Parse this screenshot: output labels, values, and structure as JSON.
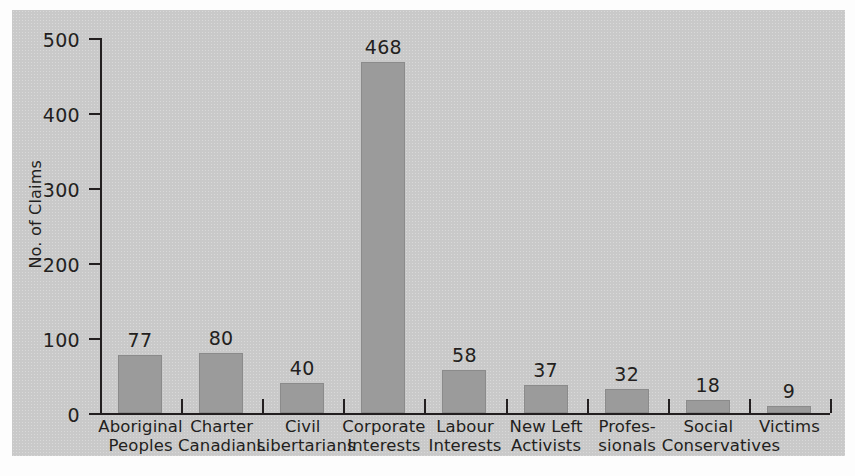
{
  "chart_data": {
    "type": "bar",
    "title": "",
    "xlabel": "",
    "ylabel": "No. of Claims",
    "ylim": [
      0,
      500
    ],
    "yticks": [
      0,
      100,
      200,
      300,
      400,
      500
    ],
    "ytick_labels": [
      "0",
      "100",
      "200",
      "300",
      "400",
      "500"
    ],
    "grid": false,
    "legend": null,
    "bar_color": "#9b9b9b",
    "panel_color": "#c9c9c9",
    "axis_color": "#231f20",
    "categories": [
      "Aboriginal Peoples",
      "Charter Canadians",
      "Civil Libertarians",
      "Corporate Interests",
      "Labour Interests",
      "New Left Activists",
      "Professionals",
      "Social Conservatives",
      "Victims"
    ],
    "category_lines": [
      [
        "Aboriginal",
        "Peoples"
      ],
      [
        "Charter",
        "Canadians"
      ],
      [
        "Civil",
        "Libertarians"
      ],
      [
        "Corporate",
        "Interests"
      ],
      [
        "Labour",
        "Interests"
      ],
      [
        "New Left",
        "Activists"
      ],
      [
        "Profes-",
        "sionals"
      ],
      [
        "Social",
        "Conservatives"
      ],
      [
        "Victims",
        ""
      ]
    ],
    "values": [
      77,
      80,
      40,
      468,
      58,
      37,
      32,
      18,
      9
    ],
    "value_labels": [
      "77",
      "80",
      "40",
      "468",
      "58",
      "37",
      "32",
      "18",
      "9"
    ]
  }
}
